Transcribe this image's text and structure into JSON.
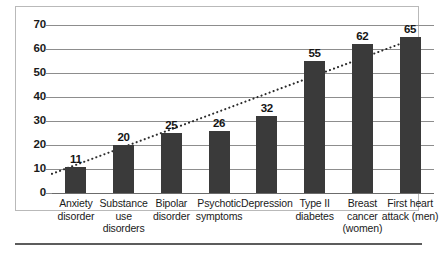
{
  "chart_data": {
    "type": "bar",
    "title": "",
    "subtitle": "",
    "xlabel": "",
    "ylabel": "",
    "ylim": [
      0,
      70
    ],
    "yticks": [
      0,
      10,
      20,
      30,
      40,
      50,
      60,
      70
    ],
    "grid": true,
    "legend": "none",
    "categories": [
      "Anxiety disorder",
      "Substance use disorders",
      "Bipolar disorder",
      "Psychotic symptoms",
      "Depression",
      "Type II diabetes",
      "Breast cancer (women)",
      "First heart attack (men)"
    ],
    "category_lines": [
      [
        "Anxiety",
        "disorder"
      ],
      [
        "Substance",
        "use",
        "disorders"
      ],
      [
        "Bipolar",
        "disorder"
      ],
      [
        "Psychotic",
        "symptoms"
      ],
      [
        "Depression"
      ],
      [
        "Type II",
        "diabetes"
      ],
      [
        "Breast",
        "cancer",
        "(women)"
      ],
      [
        "First heart",
        "attack (men)"
      ]
    ],
    "values": [
      11,
      20,
      25,
      26,
      32,
      55,
      62,
      65
    ],
    "value_labels": [
      "11",
      "20",
      "25",
      "26",
      "32",
      "55",
      "62",
      "65"
    ],
    "series": [
      {
        "name": "bars",
        "type": "bar",
        "values": [
          11,
          20,
          25,
          26,
          32,
          55,
          62,
          65
        ]
      },
      {
        "name": "trend",
        "type": "line",
        "style": "dotted",
        "values": [
          8,
          16,
          24,
          32,
          40,
          48,
          56,
          64
        ]
      }
    ],
    "colors": {
      "bar": "#3a3a3a",
      "gridline": "#8d8d8d",
      "trendline": "#2b2b2b",
      "text": "#1a1a1a",
      "frame": "#b9b9b9",
      "rule": "#5c5c5c"
    }
  }
}
